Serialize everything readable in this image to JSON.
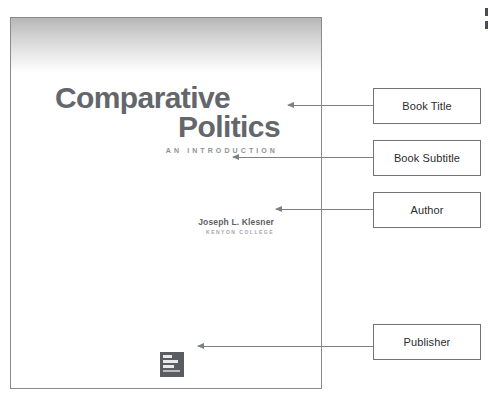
{
  "page": {
    "background_color": "#ffffff",
    "width": 488,
    "height": 398
  },
  "book_cover": {
    "name": "book-cover-image",
    "border_color": "#8a8a8a",
    "gradient_top_color": "#b7b7b7",
    "gradient_bottom_color": "#ffffff",
    "title_line_1": "Comparative",
    "title_line_2": "Politics",
    "title_color": "#63666a",
    "subtitle": "AN INTRODUCTION",
    "subtitle_color": "#8e9196",
    "author_name": "Joseph L. Klesner",
    "author_color": "#5d6066",
    "author_affiliation": "KENYON COLLEGE",
    "author_affiliation_color": "#a4a7ac",
    "publisher_logo": {
      "name": "mcgraw-hill-logo",
      "color": "#595d62",
      "alt_text": "McGraw Hill Education"
    }
  },
  "annotations": {
    "border_color": "#6f7276",
    "arrow_color": "#7c7f83",
    "items": [
      {
        "id": "book-title",
        "label": "Book Title"
      },
      {
        "id": "book-subtitle",
        "label": "Book Subtitle"
      },
      {
        "id": "author",
        "label": "Author"
      },
      {
        "id": "publisher",
        "label": "Publisher"
      }
    ]
  }
}
